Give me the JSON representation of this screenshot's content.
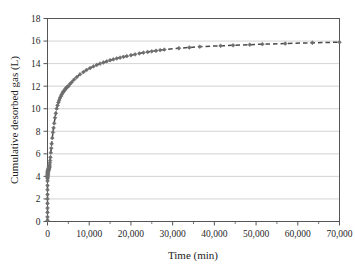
{
  "chart_data": {
    "type": "scatter",
    "title": "",
    "xlabel": "Time (min)",
    "ylabel": "Cumulative desorbed gas (L)",
    "xlim": [
      0,
      70000
    ],
    "ylim": [
      0,
      18
    ],
    "xticks": [
      0,
      10000,
      20000,
      30000,
      40000,
      50000,
      60000,
      70000
    ],
    "xtick_labels": [
      "0",
      "10,000",
      "20,000",
      "30,000",
      "40,000",
      "50,000",
      "60,000",
      "70,000"
    ],
    "xminor_ticks": [
      5000,
      15000,
      25000,
      35000,
      45000,
      55000,
      65000
    ],
    "yticks": [
      0,
      2,
      4,
      6,
      8,
      10,
      12,
      14,
      16,
      18
    ],
    "ytick_labels": [
      "0",
      "2",
      "4",
      "6",
      "8",
      "10",
      "12",
      "14",
      "16",
      "18"
    ],
    "grid": {
      "horizontal": true,
      "vertical": false,
      "color": "#c8c8c8"
    },
    "legend": {
      "visible": false,
      "position": "none"
    },
    "series": [
      {
        "name": "Cumulative desorbed gas",
        "marker": "diamond",
        "marker_color": "#6e6e6e",
        "line_style": "dashed",
        "line_color": "#4a4a4a",
        "x": [
          0,
          0,
          0,
          0,
          0,
          0,
          0,
          0,
          0,
          0,
          5,
          10,
          15,
          20,
          25,
          30,
          40,
          50,
          60,
          70,
          80,
          90,
          100,
          120,
          140,
          160,
          180,
          200,
          220,
          240,
          260,
          280,
          300,
          320,
          340,
          360,
          380,
          400,
          430,
          460,
          500,
          560,
          620,
          700,
          800,
          900,
          1000,
          1150,
          1300,
          1450,
          1600,
          1800,
          2000,
          2200,
          2400,
          2600,
          2800,
          3000,
          3200,
          3400,
          3600,
          3800,
          4000,
          4200,
          4400,
          4600,
          4800,
          5000,
          5400,
          5800,
          6400,
          7000,
          7800,
          8600,
          9400,
          10200,
          11000,
          11800,
          12600,
          13400,
          14200,
          15000,
          15800,
          16600,
          17400,
          18200,
          19000,
          20000,
          21000,
          22000,
          23000,
          24000,
          25000,
          26000,
          27000,
          28000,
          31500,
          34000,
          36500,
          41500,
          44500,
          48500,
          51500,
          57000,
          63500,
          70000
        ],
        "y": [
          0.1,
          0.4,
          0.8,
          1.2,
          1.6,
          2.0,
          2.4,
          2.8,
          3.2,
          3.6,
          3.8,
          3.9,
          4.0,
          4.05,
          4.1,
          4.15,
          4.2,
          4.25,
          4.3,
          4.35,
          4.4,
          4.42,
          4.45,
          4.48,
          4.5,
          4.52,
          4.55,
          4.58,
          4.6,
          4.62,
          4.65,
          4.67,
          4.7,
          4.72,
          4.74,
          4.76,
          4.78,
          4.8,
          4.85,
          4.9,
          5.0,
          5.2,
          5.4,
          5.7,
          6.1,
          6.5,
          6.9,
          7.4,
          7.9,
          8.3,
          8.7,
          9.2,
          9.6,
          10.0,
          10.3,
          10.55,
          10.75,
          10.95,
          11.1,
          11.25,
          11.4,
          11.5,
          11.6,
          11.7,
          11.8,
          11.88,
          11.95,
          12.0,
          12.2,
          12.35,
          12.6,
          12.8,
          13.05,
          13.25,
          13.45,
          13.6,
          13.75,
          13.88,
          14.0,
          14.1,
          14.2,
          14.3,
          14.38,
          14.46,
          14.53,
          14.6,
          14.66,
          14.74,
          14.82,
          14.9,
          14.97,
          15.03,
          15.09,
          15.14,
          15.19,
          15.24,
          15.36,
          15.43,
          15.5,
          15.58,
          15.62,
          15.68,
          15.72,
          15.78,
          15.85,
          15.9
        ]
      }
    ]
  },
  "axis_style": {
    "frame_color": "#555555",
    "tick_color": "#555555"
  }
}
